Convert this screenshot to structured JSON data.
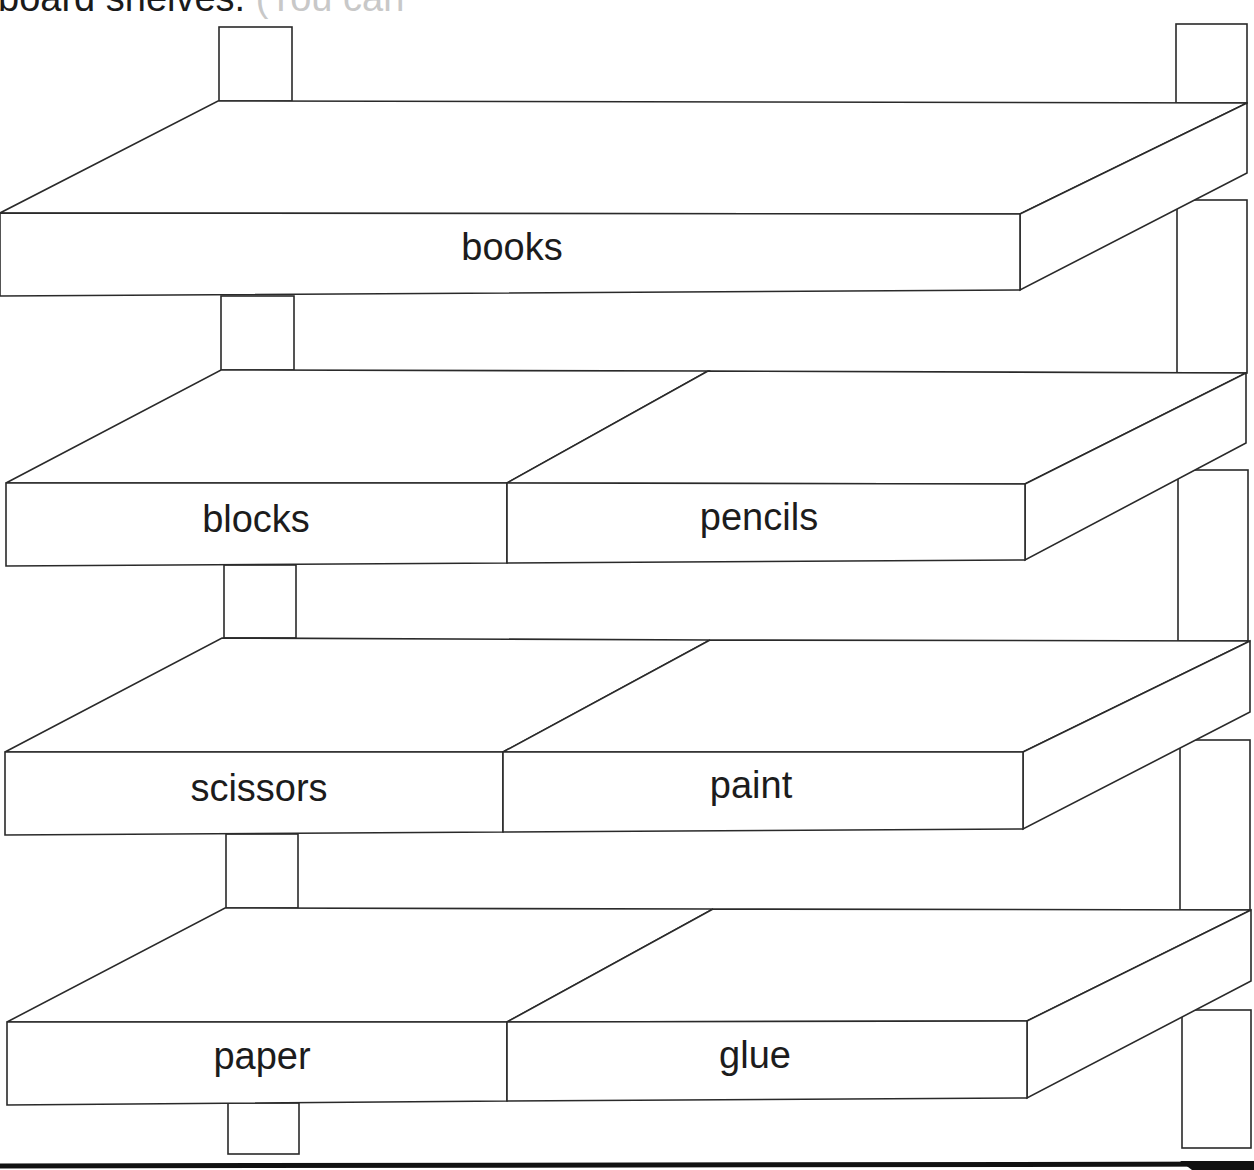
{
  "heading": {
    "visible_text": "board shelves.",
    "faded_text": " (You can",
    "note": "cropped at top edge"
  },
  "shelving_unit": {
    "shelves": [
      {
        "level": 1,
        "sections": [
          {
            "label": "books"
          }
        ]
      },
      {
        "level": 2,
        "sections": [
          {
            "label": "blocks"
          },
          {
            "label": "pencils"
          }
        ]
      },
      {
        "level": 3,
        "sections": [
          {
            "label": "scissors"
          },
          {
            "label": "paint"
          }
        ]
      },
      {
        "level": 4,
        "sections": [
          {
            "label": "paper"
          },
          {
            "label": "glue"
          }
        ]
      }
    ],
    "colors": {
      "line": "#2a2a2a",
      "fill": "#ffffff",
      "floor": "#111111"
    }
  }
}
